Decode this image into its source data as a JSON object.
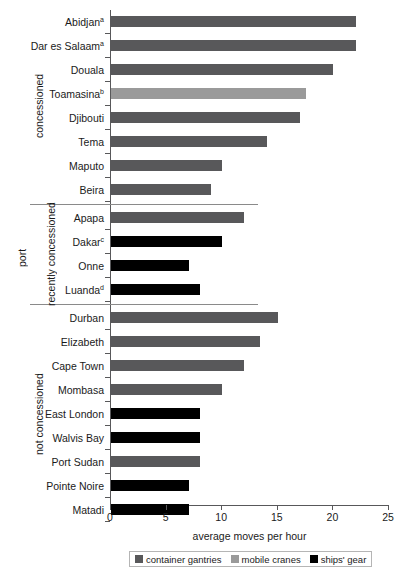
{
  "chart_data": {
    "type": "bar",
    "orientation": "horizontal",
    "title": "",
    "xlabel": "average moves per hour",
    "ylabel": "port",
    "xlim": [
      0,
      25
    ],
    "xticks": [
      0,
      5,
      10,
      15,
      20,
      25
    ],
    "grid": false,
    "legend_position": "bottom",
    "legend": [
      {
        "name": "container gantries",
        "color": "#58585a"
      },
      {
        "name": "mobile cranes",
        "color": "#9a9a9a"
      },
      {
        "name": "ships' gear",
        "color": "#000000"
      }
    ],
    "groups": [
      {
        "label": "concessioned",
        "categories": [
          {
            "label": "Abidjan",
            "superscript": "a",
            "value": 22.0,
            "series": "container gantries"
          },
          {
            "label": "Dar es Salaam",
            "superscript": "a",
            "value": 22.0,
            "series": "container gantries"
          },
          {
            "label": "Douala",
            "superscript": "",
            "value": 20.0,
            "series": "container gantries"
          },
          {
            "label": "Toamasina",
            "superscript": "b",
            "value": 17.5,
            "series": "mobile cranes"
          },
          {
            "label": "Djibouti",
            "superscript": "",
            "value": 17.0,
            "series": "container gantries"
          },
          {
            "label": "Tema",
            "superscript": "",
            "value": 14.0,
            "series": "container gantries"
          },
          {
            "label": "Maputo",
            "superscript": "",
            "value": 10.0,
            "series": "container gantries"
          },
          {
            "label": "Beira",
            "superscript": "",
            "value": 9.0,
            "series": "container gantries"
          }
        ]
      },
      {
        "label": "recently concessioned",
        "categories": [
          {
            "label": "Apapa",
            "superscript": "",
            "value": 12.0,
            "series": "container gantries"
          },
          {
            "label": "Dakar",
            "superscript": "c",
            "value": 10.0,
            "series": "ships' gear"
          },
          {
            "label": "Onne",
            "superscript": "",
            "value": 7.0,
            "series": "ships' gear"
          },
          {
            "label": "Luanda",
            "superscript": "d",
            "value": 8.0,
            "series": "ships' gear"
          }
        ]
      },
      {
        "label": "not concessioned",
        "categories": [
          {
            "label": "Durban",
            "superscript": "",
            "value": 15.0,
            "series": "container gantries"
          },
          {
            "label": "Elizabeth",
            "superscript": "",
            "value": 13.4,
            "series": "container gantries"
          },
          {
            "label": "Cape Town",
            "superscript": "",
            "value": 12.0,
            "series": "container gantries"
          },
          {
            "label": "Mombasa",
            "superscript": "",
            "value": 10.0,
            "series": "container gantries"
          },
          {
            "label": "East London",
            "superscript": "",
            "value": 8.0,
            "series": "ships' gear"
          },
          {
            "label": "Walvis Bay",
            "superscript": "",
            "value": 8.0,
            "series": "ships' gear"
          },
          {
            "label": "Port Sudan",
            "superscript": "",
            "value": 8.0,
            "series": "container gantries"
          },
          {
            "label": "Pointe Noire",
            "superscript": "",
            "value": 7.0,
            "series": "ships' gear"
          },
          {
            "label": "Matadi",
            "superscript": "",
            "value": 7.0,
            "series": "ships' gear"
          }
        ]
      }
    ]
  }
}
